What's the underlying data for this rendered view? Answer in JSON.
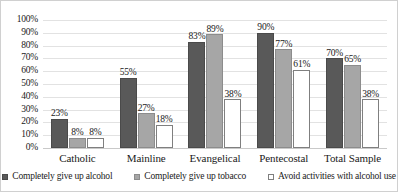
{
  "chart_data": {
    "type": "bar",
    "title": "",
    "xlabel": "",
    "ylabel": "",
    "ylim": [
      0,
      100
    ],
    "grid": true,
    "legend_position": "bottom",
    "categories": [
      "Catholic",
      "Mainline",
      "Evangelical",
      "Pentecostal",
      "Total Sample"
    ],
    "ytick_labels": [
      "100%",
      "90%",
      "80%",
      "70%",
      "60%",
      "50%",
      "40%",
      "30%",
      "20%",
      "10%",
      "0%"
    ],
    "ytick_values": [
      100,
      90,
      80,
      70,
      60,
      50,
      40,
      30,
      20,
      10,
      0
    ],
    "series": [
      {
        "name": "Completely give up alcohol",
        "color": "#595959",
        "values": [
          23,
          55,
          83,
          90,
          70
        ],
        "labels": [
          "23%",
          "55%",
          "83%",
          "90%",
          "70%"
        ]
      },
      {
        "name": "Completely give up tobacco",
        "color": "#a6a6a6",
        "values": [
          8,
          27,
          89,
          77,
          65
        ],
        "labels": [
          "8%",
          "27%",
          "89%",
          "77%",
          "65%"
        ]
      },
      {
        "name": "Avoid activities with alcohol use",
        "color": "#ffffff",
        "values": [
          8,
          18,
          38,
          61,
          38
        ],
        "labels": [
          "8%",
          "18%",
          "38%",
          "61%",
          "38%"
        ]
      }
    ]
  }
}
